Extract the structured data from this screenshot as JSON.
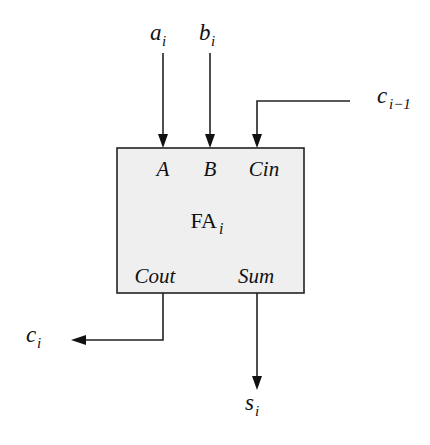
{
  "diagram": {
    "block": {
      "name_main": "FA",
      "name_sub": "i",
      "fill": "#efefef",
      "stroke": "#222222",
      "ports": {
        "a": "A",
        "b": "B",
        "cin": "Cin",
        "cout": "Cout",
        "sum": "Sum"
      }
    },
    "signals": {
      "a_in": {
        "main": "a",
        "sub": "i"
      },
      "b_in": {
        "main": "b",
        "sub": "i"
      },
      "c_in": {
        "main": "c",
        "sub": "i−1"
      },
      "c_out": {
        "main": "c",
        "sub": "i"
      },
      "s_out": {
        "main": "s",
        "sub": "i"
      }
    }
  }
}
